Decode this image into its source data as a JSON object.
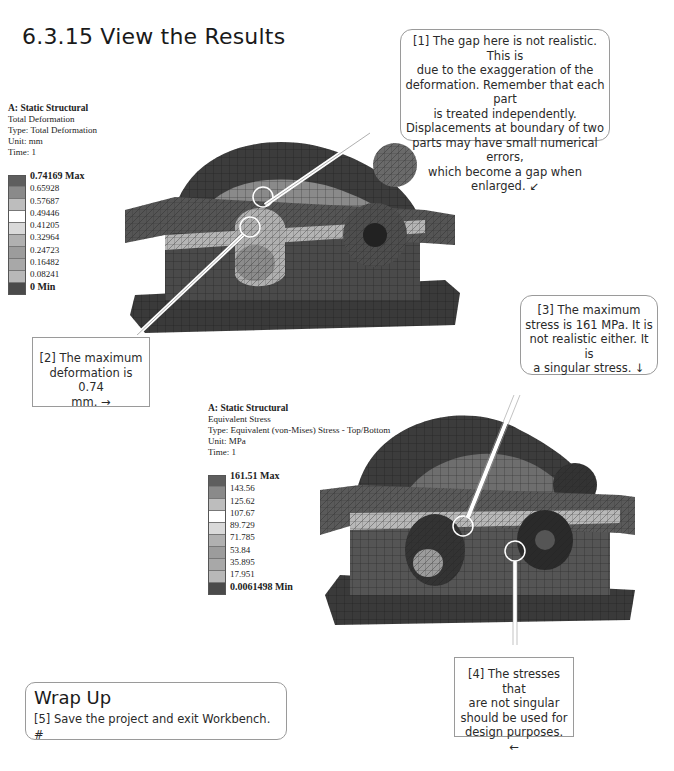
{
  "section": {
    "number": "6.3.15",
    "title": "6.3.15 View the Results"
  },
  "deformation_result": {
    "header": {
      "system": "A: Static Structural",
      "name": "Total Deformation",
      "type": "Type: Total Deformation",
      "unit": "Unit: mm",
      "time": "Time: 1"
    },
    "legend": {
      "max_label": "0.74169 Max",
      "values": [
        "0.65928",
        "0.57687",
        "0.49446",
        "0.41205",
        "0.32964",
        "0.24723",
        "0.16482",
        "0.08241"
      ],
      "min_label": "0 Min",
      "swatch_colors": [
        "#5e5e5e",
        "#8a8a8a",
        "#bdbdbd",
        "#ffffff",
        "#d9d9d9",
        "#b0b0b0",
        "#9c9c9c",
        "#a8a8a8",
        "#b8b8b8",
        "#4a4a4a"
      ]
    }
  },
  "stress_result": {
    "header": {
      "system": "A: Static Structural",
      "name": "Equivalent Stress",
      "type": "Type: Equivalent (von-Mises) Stress - Top/Bottom",
      "unit": "Unit: MPa",
      "time": "Time: 1"
    },
    "legend": {
      "max_label": "161.51 Max",
      "values": [
        "143.56",
        "125.62",
        "107.67",
        "89.729",
        "71.785",
        "53.84",
        "35.895",
        "17.951"
      ],
      "min_label": "0.0061498 Min",
      "swatch_colors": [
        "#5e5e5e",
        "#8a8a8a",
        "#bdbdbd",
        "#ffffff",
        "#d9d9d9",
        "#b0b0b0",
        "#9c9c9c",
        "#a8a8a8",
        "#b8b8b8",
        "#4a4a4a"
      ]
    }
  },
  "callouts": {
    "c1": {
      "lines": [
        "[1] The gap here is not realistic. This is",
        "due to the exaggeration of the",
        "deformation.  Remember that each part",
        "is treated independently.",
        "Displacements at boundary of two",
        "parts may have small numerical errors,",
        "which become a gap when enlarged.  ↙"
      ]
    },
    "c2": {
      "lines": [
        "[2] The maximum",
        "deformation is 0.74",
        "mm.  →"
      ]
    },
    "c3": {
      "lines": [
        "[3] The maximum",
        "stress is 161 MPa.  It is",
        "not realistic either.  It is",
        "a singular stress.  ↓"
      ]
    },
    "c4": {
      "lines": [
        "[4] The stresses that",
        "are not singular",
        "should be used for",
        "design purposes.  ←"
      ]
    }
  },
  "wrap_up": {
    "title": "Wrap Up",
    "step": "[5] Save the project and exit Workbench.  #"
  },
  "colors": {
    "mesh_dark": "#2e2e2e",
    "mesh_mid": "#6a6a6a",
    "mesh_light": "#a8a8a8",
    "callout_border": "#9a9a9a",
    "highlight_circle": "#ffffff"
  }
}
